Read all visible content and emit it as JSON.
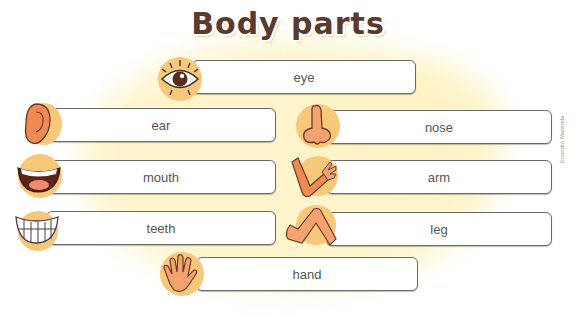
{
  "title": "Body parts",
  "credit": "Evandro Marenda",
  "colors": {
    "title_text": "#5a3a2c",
    "icon_blob": "#f7c77a",
    "skin": "#f4a36f",
    "outline": "#6a3a28",
    "box_border": "#6a6a6a",
    "background_wash": "#fdf3c4"
  },
  "items": [
    {
      "label": "eye",
      "icon": "eye-icon"
    },
    {
      "label": "ear",
      "icon": "ear-icon"
    },
    {
      "label": "nose",
      "icon": "nose-icon"
    },
    {
      "label": "mouth",
      "icon": "mouth-icon"
    },
    {
      "label": "arm",
      "icon": "arm-icon"
    },
    {
      "label": "teeth",
      "icon": "teeth-icon"
    },
    {
      "label": "leg",
      "icon": "leg-icon"
    },
    {
      "label": "hand",
      "icon": "hand-icon"
    }
  ]
}
